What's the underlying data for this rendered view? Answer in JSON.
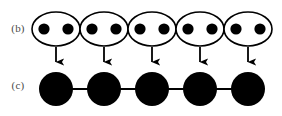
{
  "figure": {
    "caption_labels": {
      "row_b": "(b)",
      "row_c": "(c)"
    },
    "colors": {
      "node_fill": "#000000",
      "group_outline": "#000000",
      "bond_line": "#000000",
      "arrow": "#000000",
      "label_text": "#4a4a4a",
      "background": "#ffffff"
    }
  },
  "chart_data": {
    "type": "diagram",
    "title": "",
    "rows": [
      {
        "id": "b",
        "label": "(b)",
        "label_x": 18,
        "label_y": 32,
        "kind": "grouped-chain",
        "group_count": 5,
        "sites_per_group": 2,
        "group_rx": 24,
        "group_ry": 17,
        "group_cy": 29,
        "group_centers_x": [
          56,
          104,
          152,
          200,
          248
        ],
        "site_radius": 5.6,
        "site_cy": 29,
        "site_centers_x": [
          44,
          68,
          92,
          116,
          140,
          164,
          188,
          212,
          236,
          260
        ],
        "bond_y": 29,
        "bond_x_start": 44,
        "bond_x_end": 260,
        "bond_width": 1.6,
        "outline_width": 1.6
      },
      {
        "id": "c",
        "label": "(c)",
        "label_x": 18,
        "label_y": 89,
        "kind": "chain",
        "node_count": 5,
        "node_radius": 17,
        "node_cy": 89,
        "node_centers_x": [
          56,
          104,
          152,
          200,
          248
        ],
        "bond_y": 89,
        "bond_x_start": 56,
        "bond_x_end": 248,
        "bond_width": 2.0
      }
    ],
    "arrows": {
      "count": 5,
      "x_positions": [
        56,
        104,
        152,
        200,
        248
      ],
      "y_start": 47,
      "y_end": 71,
      "shaft_width": 1.8,
      "head_width": 8,
      "head_length": 9,
      "direction": "down"
    }
  }
}
